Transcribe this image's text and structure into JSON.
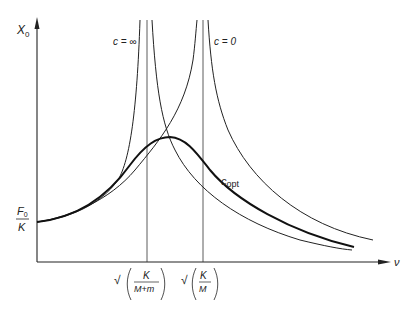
{
  "diagram": {
    "type": "resonance-curves",
    "y_axis_label": "X",
    "y_axis_subscript": "0",
    "x_axis_label": "ν",
    "y_intercept_label": {
      "numerator": "F",
      "numerator_subscript": "0",
      "denominator": "K"
    },
    "x_ticks": [
      {
        "prefix": "√",
        "numerator": "K",
        "denominator": "M+m"
      },
      {
        "prefix": "√",
        "numerator": "K",
        "denominator": "M"
      }
    ],
    "curves": [
      {
        "name": "c = ∞",
        "label": "c = ∞",
        "resonance_at": "√(K/(M+m))"
      },
      {
        "name": "c = 0",
        "label": "c = 0",
        "resonance_at": "√(K/M)"
      },
      {
        "name": "c_opt",
        "label_main": "c",
        "label_sub": "opt",
        "style": "bold"
      }
    ],
    "colors": {
      "line": "#222222",
      "background": "#ffffff"
    }
  }
}
